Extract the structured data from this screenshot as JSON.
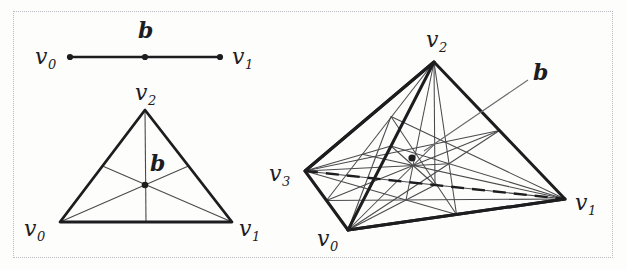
{
  "figure": {
    "caption_present": false,
    "background_color": "#fdfdfc",
    "border_color": "#b9bcc0",
    "ink_color": "#1d1d1f",
    "thin_ink_color": "#4a4a4d"
  },
  "panels": [
    {
      "id": "one-simplex",
      "name": "1-simplex segment with barycenter",
      "vertex_labels": [
        "v",
        "v"
      ],
      "vertex_subscripts": [
        "0",
        "1"
      ],
      "barycenter_label": "b",
      "vertices": [
        {
          "label": "v",
          "sub": "0",
          "x": 70,
          "y": 57
        },
        {
          "label": "v",
          "sub": "1",
          "x": 220,
          "y": 57
        }
      ],
      "barycenter": {
        "label": "b",
        "x": 145,
        "y": 57
      }
    },
    {
      "id": "two-simplex",
      "name": "2-simplex triangle with medians and barycenter",
      "barycenter_label": "b",
      "vertices": [
        {
          "label": "v",
          "sub": "0",
          "x": 60,
          "y": 222
        },
        {
          "label": "v",
          "sub": "1",
          "x": 232,
          "y": 222
        },
        {
          "label": "v",
          "sub": "2",
          "x": 145,
          "y": 110
        }
      ],
      "barycenter": {
        "label": "b",
        "x": 145,
        "y": 185
      }
    },
    {
      "id": "three-simplex",
      "name": "3-simplex tetrahedron with barycentric subdivision",
      "barycenter_label": "b",
      "vertices": [
        {
          "label": "v",
          "sub": "0",
          "x": 348,
          "y": 230
        },
        {
          "label": "v",
          "sub": "1",
          "x": 565,
          "y": 199
        },
        {
          "label": "v",
          "sub": "2",
          "x": 434,
          "y": 62
        },
        {
          "label": "v",
          "sub": "3",
          "x": 305,
          "y": 171
        }
      ],
      "barycenter": {
        "label": "b",
        "x": 412,
        "y": 158
      },
      "hidden_edge": {
        "from": "v3",
        "to": "v1",
        "style": "dashed"
      },
      "leader_line": {
        "from_x": 424,
        "from_y": 151,
        "to_x": 528,
        "to_y": 80
      }
    }
  ],
  "labels": {
    "seg_v0": "v",
    "seg_v0_sub": "0",
    "seg_v1": "v",
    "seg_v1_sub": "1",
    "seg_b": "b",
    "tri_v0": "v",
    "tri_v0_sub": "0",
    "tri_v1": "v",
    "tri_v1_sub": "1",
    "tri_v2": "v",
    "tri_v2_sub": "2",
    "tri_b": "b",
    "tet_v0": "v",
    "tet_v0_sub": "0",
    "tet_v1": "v",
    "tet_v1_sub": "1",
    "tet_v2": "v",
    "tet_v2_sub": "2",
    "tet_v3": "v",
    "tet_v3_sub": "3",
    "tet_b": "b"
  }
}
